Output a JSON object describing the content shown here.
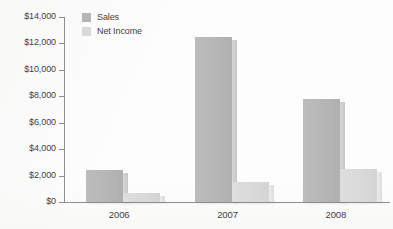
{
  "chart_data": {
    "type": "bar",
    "title": "",
    "subtitle": "",
    "xlabel": "",
    "ylabel": "",
    "categories": [
      "2006",
      "2007",
      "2008"
    ],
    "series": [
      {
        "name": "Sales",
        "color": "#b6b6b6",
        "values": [
          2400,
          12500,
          7800
        ]
      },
      {
        "name": "Net Income",
        "color": "#d9d9d9",
        "values": [
          700,
          1500,
          2500
        ]
      }
    ],
    "ylim": [
      0,
      14000
    ],
    "ytick_values": [
      0,
      2000,
      4000,
      6000,
      8000,
      10000,
      12000,
      14000
    ],
    "ytick_labels": [
      "$0",
      "$2,000",
      "$4,000",
      "$6,000",
      "$8,000",
      "$10,000",
      "$12,000",
      "$14,000"
    ],
    "grid": false,
    "legend_position": "top-left",
    "annotations": []
  },
  "legend": {
    "entries": [
      {
        "label": "Sales"
      },
      {
        "label": "Net Income"
      }
    ]
  },
  "colors": {
    "sales": "#b6b6b6",
    "net_income": "#d9d9d9",
    "axis": "#8e8e8e",
    "text": "#3f3f3f",
    "background": "#fdfdfd"
  }
}
